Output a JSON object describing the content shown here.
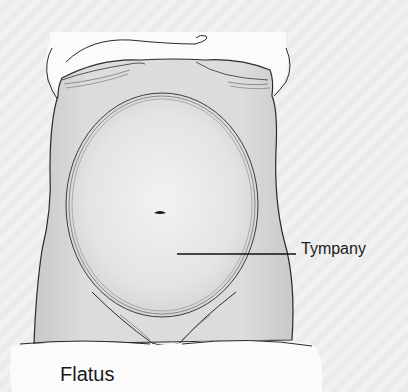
{
  "figure": {
    "colors": {
      "background": "#efefef",
      "skin": "#d6d6d6",
      "skin_light": "#e6e6e6",
      "sheet": "#fbfbfb",
      "outline": "#2a2a2a",
      "label_text": "#1a1a1a"
    }
  },
  "labels": {
    "tympany": "Tympany",
    "flatus": "Flatus"
  }
}
